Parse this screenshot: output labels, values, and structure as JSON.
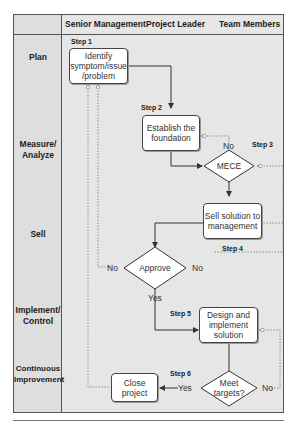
{
  "columns": [
    "Senior Management",
    "Project Leader",
    "Team Members"
  ],
  "phases": [
    "Plan",
    "Measure/ Analyze",
    "Sell",
    "Implement/ Control",
    "Continuous Improvement"
  ],
  "steps": {
    "s1": "Step 1",
    "s2": "Step 2",
    "s3": "Step 3",
    "s4": "Step 4",
    "s5": "Step 5",
    "s6": "Step 6"
  },
  "nodes": {
    "identify": "Identify symptom/issue /problem",
    "foundation": "Establish the foundation",
    "mece": "MECE",
    "sell": "Sell solution to management",
    "approve": "Approve",
    "design": "Design and implement solution",
    "meet": "Meet targets?",
    "close": "Close project"
  },
  "edge_labels": {
    "mece_no": "No",
    "approve_no_left": "No",
    "approve_no_right": "No",
    "approve_yes": "Yes",
    "meet_yes": "Yes",
    "meet_no": "No"
  }
}
